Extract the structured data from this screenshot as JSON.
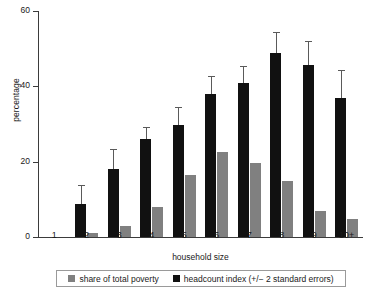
{
  "chart_data": {
    "type": "bar",
    "title": "",
    "xlabel": "household size",
    "ylabel": "percentage",
    "categories": [
      "1",
      "2",
      "3",
      "4",
      "5",
      "6",
      "7",
      "8",
      "9",
      "10+"
    ],
    "ylim": [
      0,
      60
    ],
    "yticks": [
      0,
      20,
      40,
      60
    ],
    "grid": false,
    "legend_position": "bottom",
    "series": [
      {
        "name": "share of total poverty",
        "color": "#808080",
        "values": [
          0,
          1,
          3,
          8,
          16.5,
          22.7,
          19.7,
          14.8,
          6.8,
          4.8
        ]
      },
      {
        "name": "headcount index (+/- 2 standard errors)",
        "color": "#111111",
        "values": [
          0,
          8.8,
          18,
          25.9,
          29.8,
          37.9,
          40.8,
          48.8,
          45.7,
          37.0
        ],
        "error_upper": [
          0,
          13.7,
          23.4,
          29.2,
          34.6,
          42.7,
          45.3,
          54.4,
          52.1,
          44.3
        ],
        "error_lower": [
          0,
          3.9,
          12.6,
          22.6,
          25.0,
          33.1,
          36.3,
          43.2,
          39.3,
          29.7
        ]
      }
    ]
  },
  "axis": {
    "y_tick_labels": [
      "0",
      "20",
      "40",
      "60"
    ],
    "y_title": "percentage",
    "x_title": "household size"
  },
  "legend": {
    "items": [
      {
        "label": "share of total poverty",
        "swatch": "gray"
      },
      {
        "label": "headcount index (+/− 2 standard errors)",
        "swatch": "black"
      }
    ]
  }
}
